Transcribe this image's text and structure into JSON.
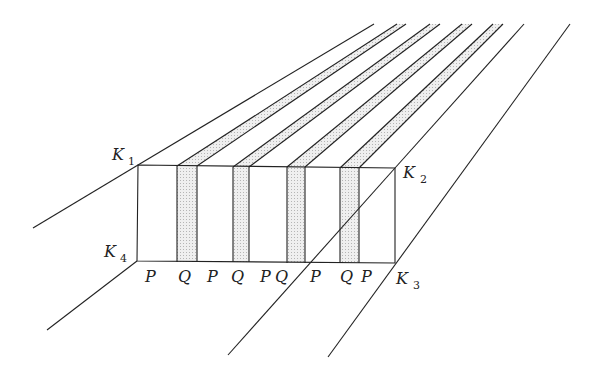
{
  "diagram": {
    "corners": [
      {
        "name": "K",
        "sub": "1",
        "x": 112,
        "y": 160,
        "sx": 128,
        "sy": 165
      },
      {
        "name": "K",
        "sub": "2",
        "x": 403,
        "y": 178,
        "sx": 420,
        "sy": 183
      },
      {
        "name": "K",
        "sub": "3",
        "x": 396,
        "y": 284,
        "sx": 413,
        "sy": 289
      },
      {
        "name": "K",
        "sub": "4",
        "x": 104,
        "y": 257,
        "sx": 120,
        "sy": 262
      }
    ],
    "bottom_labels": [
      {
        "text": "P",
        "x": 145
      },
      {
        "text": "Q",
        "x": 178
      },
      {
        "text": "P",
        "x": 207
      },
      {
        "text": "Q",
        "x": 231
      },
      {
        "text": "P",
        "x": 260
      },
      {
        "text": "Q",
        "x": 275
      },
      {
        "text": "P",
        "x": 310
      },
      {
        "text": "Q",
        "x": 340
      },
      {
        "text": "P",
        "x": 361
      }
    ],
    "strip_fill": "#d9d9d9",
    "line_color": "#222222"
  }
}
